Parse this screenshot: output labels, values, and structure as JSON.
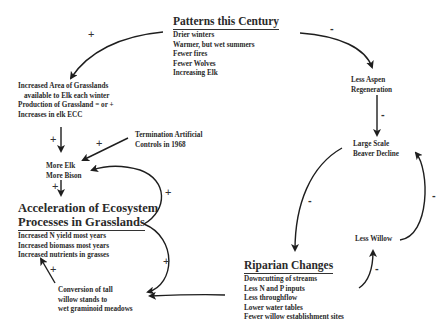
{
  "nodes": {
    "patterns": {
      "title": "Patterns this Century",
      "lines": [
        "Drier winters",
        "Warmer, but wet summers",
        "Fewer fires",
        "Fewer Wolves",
        "Increasing Elk"
      ]
    },
    "grasslands_area": {
      "lines": [
        "Increased Area of Grasslands",
        "available to Elk each winter",
        "Production of Grassland = or +",
        "Increases in elk ECC"
      ]
    },
    "termination": {
      "lines": [
        "Termination Artificial",
        "Controls in 1968"
      ]
    },
    "more_elk": {
      "lines": [
        "More Elk",
        "More Bison"
      ]
    },
    "acceleration": {
      "title_lines": [
        "Acceleration of Ecosystem",
        "Processes in Grasslands"
      ],
      "lines": [
        "Increased N yield most years",
        "Increased biomass most years",
        "Increased nutrients in grasses"
      ]
    },
    "conversion": {
      "lines": [
        "Conversion of tall",
        "willow stands to",
        "wet graminoid meadows"
      ]
    },
    "less_aspen": {
      "lines": [
        "Less Aspen",
        "Regeneration"
      ]
    },
    "beaver": {
      "lines": [
        "Large Scale",
        "Beaver Decline"
      ]
    },
    "less_willow": {
      "lines": [
        "Less Willow"
      ]
    },
    "riparian": {
      "title": "Riparian Changes",
      "lines": [
        "Downcutting of streams",
        "Less N and P inputs",
        "Less throughflow",
        "Lower water tables",
        "Fewer willow establishment sites"
      ]
    }
  },
  "signs": {
    "patterns_to_grasslands": "+",
    "patterns_to_aspen": "-",
    "grasslands_to_elk": "+",
    "termination_to_elk": "+",
    "elk_to_acceleration": "+",
    "acceleration_loop_upper": "+",
    "acceleration_loop_lower": "+",
    "conversion_to_acceleration": "+",
    "aspen_to_beaver": "-",
    "beaver_to_riparian": "-",
    "willow_to_beaver": "-",
    "riparian_to_willow": "-"
  }
}
